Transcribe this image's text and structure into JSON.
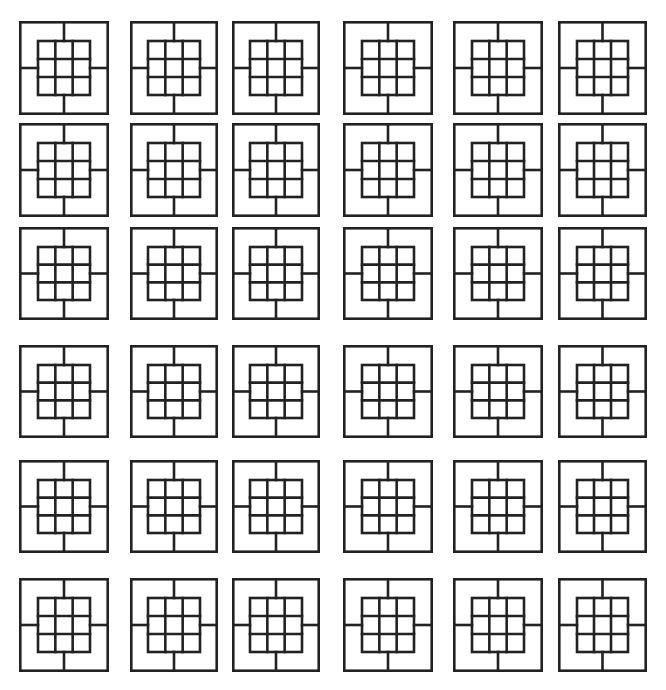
{
  "diagram": {
    "rows": 6,
    "columns": 6,
    "stroke_color": "#222222",
    "background_color": "#ffffff",
    "stroke_width": 2.6,
    "column_x": [
      19,
      130,
      232,
      343,
      453,
      558
    ],
    "column_w": [
      90,
      88,
      88,
      90,
      90,
      89
    ],
    "row_y": [
      21,
      123,
      227,
      345,
      460,
      578
    ],
    "row_h": [
      94,
      94,
      93,
      93,
      93,
      94
    ],
    "tile": {
      "inner_grid_cells": 3,
      "inner_inset_ratio": 0.21,
      "connectors": [
        "top",
        "right",
        "bottom",
        "left"
      ]
    }
  }
}
